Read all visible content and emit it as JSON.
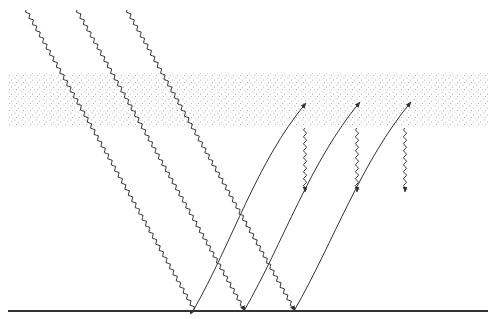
{
  "diagram": {
    "title": "",
    "colors": {
      "ink": "#333333",
      "stipple": "#9a9a9a",
      "background": "#ffffff"
    },
    "atmosphere_layer": {
      "x": 8,
      "y": 73,
      "width": 480,
      "height": 54
    },
    "ground": {
      "x1": 8,
      "x2": 488,
      "y": 311
    },
    "incoming_rays": [
      {
        "from": [
          26,
          10
        ],
        "to": [
          195,
          311
        ]
      },
      {
        "from": [
          77,
          10
        ],
        "to": [
          245,
          311
        ]
      },
      {
        "from": [
          127,
          10
        ],
        "to": [
          295,
          311
        ]
      }
    ],
    "emitted_rays": [
      {
        "from": [
          193,
          311
        ],
        "to": [
          306,
          103
        ]
      },
      {
        "from": [
          244,
          311
        ],
        "to": [
          360,
          102
        ]
      },
      {
        "from": [
          294,
          311
        ],
        "to": [
          411,
          102
        ]
      }
    ],
    "reradiated_rays": [
      {
        "x": 305,
        "from_y": 128,
        "to_y": 192
      },
      {
        "x": 357,
        "from_y": 128,
        "to_y": 192
      },
      {
        "x": 405,
        "from_y": 128,
        "to_y": 192
      }
    ]
  }
}
